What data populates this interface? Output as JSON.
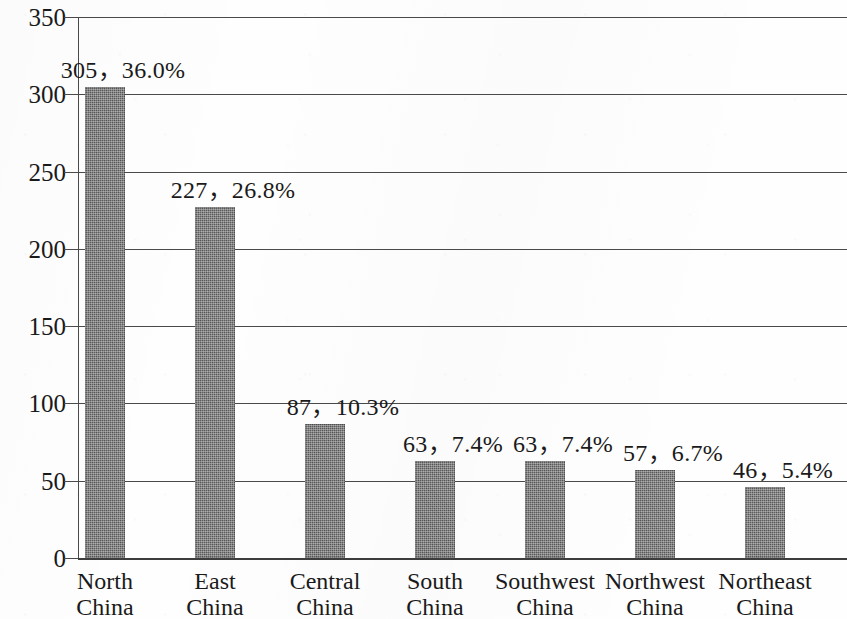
{
  "chart_data": {
    "type": "bar",
    "title": "",
    "subtitle": "",
    "xlabel": "",
    "ylabel": "",
    "ylim": [
      0,
      350
    ],
    "ytick_step": 50,
    "yticks": [
      "0",
      "50",
      "100",
      "150",
      "200",
      "250",
      "300",
      "350"
    ],
    "grid": true,
    "legend": false,
    "legend_position": "none",
    "orientation": "vertical",
    "categories": [
      "North China",
      "East China",
      "Central China",
      "South China",
      "Southwest China",
      "Northwest China",
      "Northeast China"
    ],
    "category_lines": [
      [
        "North",
        "China"
      ],
      [
        "East",
        "China"
      ],
      [
        "Central",
        "China"
      ],
      [
        "South",
        "China"
      ],
      [
        "Southwest",
        "China"
      ],
      [
        "Northwest",
        "China"
      ],
      [
        "Northeast",
        "China"
      ]
    ],
    "values": [
      305,
      227,
      87,
      63,
      63,
      57,
      46
    ],
    "percentages": [
      "36.0%",
      "26.8%",
      "10.3%",
      "7.4%",
      "7.4%",
      "6.7%",
      "5.4%"
    ],
    "data_labels": [
      "305，36.0%",
      "227，26.8%",
      "87，10.3%",
      "63，7.4%",
      "63，7.4%",
      "57，6.7%",
      "46，5.4%"
    ],
    "series": [
      {
        "name": "Count",
        "values": [
          305,
          227,
          87,
          63,
          63,
          57,
          46
        ]
      }
    ],
    "colors": {
      "bar_fill": "#5e5e5e",
      "gridline": "#4a4a4a",
      "axis": "#3d3d3d",
      "text": "#1a1a1a",
      "background": "#fefefe"
    }
  }
}
